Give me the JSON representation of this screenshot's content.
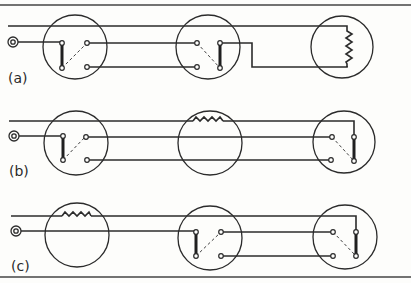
{
  "figure": {
    "colors": {
      "line": "#2b2b2b",
      "background": "#fdfdfb"
    },
    "panels": [
      {
        "label": "(a)",
        "layout": [
          "two-way switch",
          "two-way switch",
          "lamp (vertical zigzag)"
        ]
      },
      {
        "label": "(b)",
        "layout": [
          "two-way switch",
          "lamp (horizontal zigzag)",
          "two-way switch"
        ]
      },
      {
        "label": "(c)",
        "layout": [
          "lamp (horizontal zigzag)",
          "two-way switch",
          "two-way switch"
        ]
      }
    ]
  }
}
